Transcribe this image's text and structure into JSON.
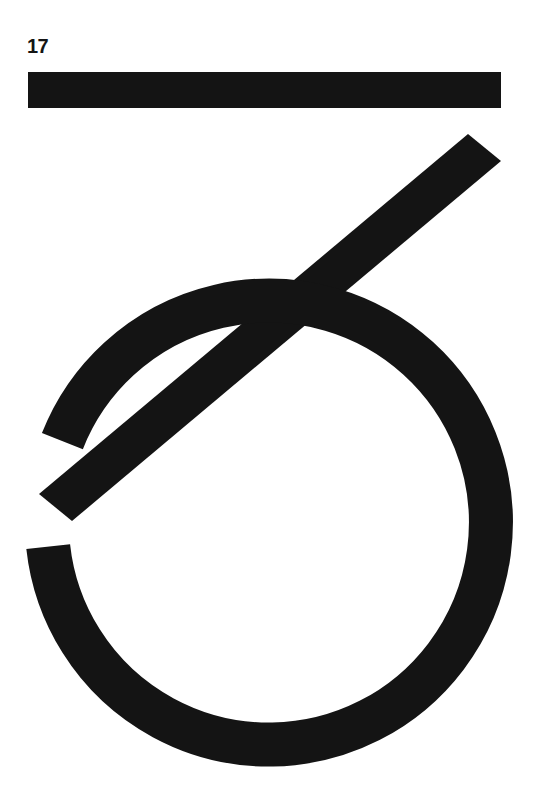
{
  "page": {
    "number": "17",
    "width": 545,
    "height": 786,
    "background_color": "#ffffff",
    "ink_color": "#141414",
    "composition_title": "17"
  },
  "artwork": {
    "description": "Abstract geometric composition of three black shapes on white",
    "shapes": [
      {
        "name": "horizontal-bar",
        "type": "rect",
        "x": 28,
        "y": 72,
        "width": 473,
        "height": 36,
        "color": "#141414"
      },
      {
        "name": "diagonal-bar",
        "type": "polygon",
        "points": "468,134 501,161 72,521 39,494",
        "angle_degrees": -40,
        "thickness": 42,
        "color": "#141414"
      },
      {
        "name": "open-circle-arc",
        "type": "arc",
        "center_x": 271,
        "center_y": 517,
        "radius": 222,
        "stroke_width": 44,
        "start_angle_degrees": 200,
        "sweep_degrees": 272,
        "color": "#141414"
      }
    ]
  }
}
